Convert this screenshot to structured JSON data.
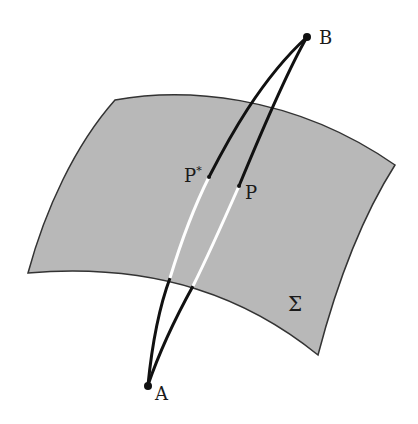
{
  "diagram": {
    "surface": {
      "label": "Σ",
      "fill": "#b8b8b8",
      "edge": "#333333"
    },
    "points": {
      "A": {
        "label": "A"
      },
      "B": {
        "label": "B"
      },
      "P": {
        "label": "P"
      },
      "P_star": {
        "label": "P",
        "superscript": "*"
      }
    },
    "curves": [
      {
        "name": "curve-through-P-star",
        "from": "A",
        "to": "B",
        "via": "P*"
      },
      {
        "name": "curve-through-P",
        "from": "A",
        "to": "B",
        "via": "P"
      }
    ],
    "colors": {
      "curve": "#111111",
      "hidden_segment": "#ffffff"
    }
  }
}
